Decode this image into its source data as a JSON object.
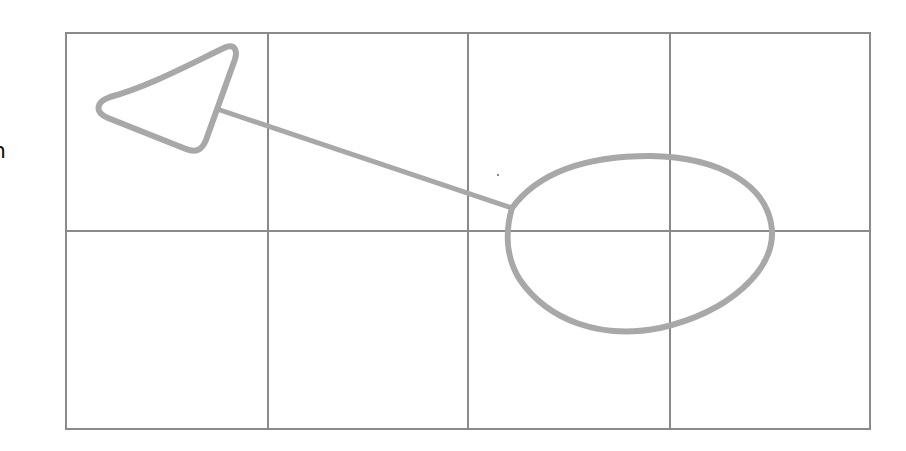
{
  "diagram": {
    "edge_text_fragment": "n",
    "grid": {
      "rows": 2,
      "cols": 4,
      "left": 66,
      "top": 33,
      "right": 870,
      "bottom": 429,
      "col_lines_x": [
        268,
        468,
        670
      ],
      "row_lines_y": [
        231
      ],
      "line_color": "#8a8a8a"
    },
    "shapes": [
      {
        "type": "triangle",
        "points": [
          [
            232,
            50
          ],
          [
            99,
            108
          ],
          [
            200,
            150
          ]
        ],
        "stroke": "#a8a8a8"
      },
      {
        "type": "line",
        "from": [
          220,
          110
        ],
        "to": [
          512,
          208
        ],
        "stroke": "#a8a8a8"
      },
      {
        "type": "ellipse",
        "cx": 640,
        "cy": 244,
        "rx": 133,
        "ry": 89,
        "stroke": "#a8a8a8"
      }
    ],
    "stray_dot": [
      498,
      175
    ]
  }
}
